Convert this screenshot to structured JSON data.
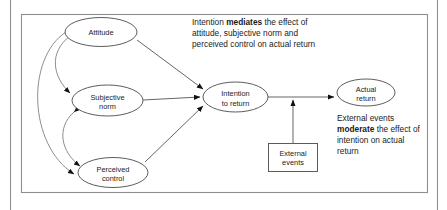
{
  "figure": {
    "colors": {
      "stroke": "#4a4a4a",
      "arc_stroke": "#7a7a7a",
      "frame": "#8e8e8e",
      "text": "#1b1b1b",
      "background": "#ffffff"
    }
  },
  "nodes": {
    "attitude": {
      "line1": "Attitude",
      "line2": ""
    },
    "subjective_norm": {
      "line1": "Subjective",
      "line2": "norm"
    },
    "perceived_control": {
      "line1": "Perceived",
      "line2": "control"
    },
    "intention": {
      "line1": "Intention",
      "line2": "to return"
    },
    "actual_return": {
      "line1": "Actual",
      "line2": "return"
    },
    "external_events": {
      "line1": "External",
      "line2": "events"
    }
  },
  "annotations": {
    "mediation": {
      "line1_a": "Intention ",
      "line1_kw": "mediates",
      "line1_b": " the effect of",
      "line2": "attitude, subjective norm and",
      "line3": "perceived control on actual return"
    },
    "moderation": {
      "line1": "External events",
      "line2_kw": "moderate",
      "line2_b": " the effect of",
      "line3": "intention on actual",
      "line4": "return"
    }
  },
  "icons": {
    "arrowhead": "arrowhead-icon",
    "correlation_arc": "double-headed-arc-icon"
  }
}
